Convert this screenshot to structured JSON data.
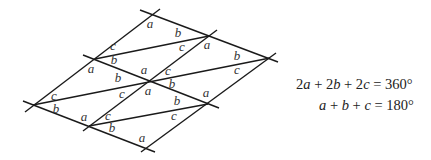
{
  "diagram": {
    "vertices": {
      "top": [
        153,
        15
      ],
      "upper_right": [
        209,
        36
      ],
      "right": [
        270,
        58
      ],
      "upper_left": [
        95,
        59
      ],
      "center": [
        150,
        80
      ],
      "mid_right": [
        208,
        104
      ],
      "left": [
        33,
        105
      ],
      "lower_left": [
        89,
        126
      ],
      "bottom": [
        145,
        148
      ]
    },
    "lines": [
      {
        "name": "top-edge",
        "from": [
          140,
          10
        ],
        "to": [
          278,
          62
        ]
      },
      {
        "name": "middle-edge",
        "from": [
          83,
          55
        ],
        "to": [
          219,
          108
        ]
      },
      {
        "name": "bottom-edge",
        "from": [
          23,
          101
        ],
        "to": [
          155,
          152
        ]
      },
      {
        "name": "left-edge",
        "from": [
          25,
          112
        ],
        "to": [
          160,
          9
        ]
      },
      {
        "name": "center-diagonal-edge",
        "from": [
          83,
          131
        ],
        "to": [
          217,
          30
        ]
      },
      {
        "name": "right-edge",
        "from": [
          141,
          152
        ],
        "to": [
          276,
          53
        ]
      },
      {
        "name": "upper-diagonal",
        "from": [
          95,
          59
        ],
        "to": [
          209,
          36
        ]
      },
      {
        "name": "middle-diagonal",
        "from": [
          33,
          105
        ],
        "to": [
          270,
          58
        ]
      },
      {
        "name": "lower-diagonal",
        "from": [
          89,
          126
        ],
        "to": [
          208,
          104
        ]
      }
    ],
    "labels": [
      {
        "text": "a",
        "x": 150,
        "y": 28
      },
      {
        "text": "b",
        "x": 178,
        "y": 37
      },
      {
        "text": "c",
        "x": 113,
        "y": 50
      },
      {
        "text": "c",
        "x": 182,
        "y": 51
      },
      {
        "text": "a",
        "x": 207,
        "y": 49
      },
      {
        "text": "b",
        "x": 114,
        "y": 64
      },
      {
        "text": "b",
        "x": 237,
        "y": 60
      },
      {
        "text": "a",
        "x": 91,
        "y": 73
      },
      {
        "text": "a",
        "x": 144,
        "y": 74
      },
      {
        "text": "c",
        "x": 168,
        "y": 75
      },
      {
        "text": "c",
        "x": 237,
        "y": 74
      },
      {
        "text": "b",
        "x": 118,
        "y": 82
      },
      {
        "text": "b",
        "x": 172,
        "y": 88
      },
      {
        "text": "a",
        "x": 148,
        "y": 95
      },
      {
        "text": "c",
        "x": 54,
        "y": 100
      },
      {
        "text": "c",
        "x": 122,
        "y": 98
      },
      {
        "text": "a",
        "x": 206,
        "y": 97
      },
      {
        "text": "b",
        "x": 177,
        "y": 105
      },
      {
        "text": "b",
        "x": 56,
        "y": 113
      },
      {
        "text": "a",
        "x": 84,
        "y": 121
      },
      {
        "text": "c",
        "x": 108,
        "y": 120
      },
      {
        "text": "c",
        "x": 174,
        "y": 120
      },
      {
        "text": "b",
        "x": 112,
        "y": 132
      },
      {
        "text": "a",
        "x": 142,
        "y": 142
      }
    ]
  },
  "equations": {
    "line1": {
      "parts": [
        {
          "t": "2",
          "i": false
        },
        {
          "t": "a",
          "i": true
        },
        {
          "t": " + 2",
          "i": false
        },
        {
          "t": "b",
          "i": true
        },
        {
          "t": " + 2",
          "i": false
        },
        {
          "t": "c",
          "i": true
        },
        {
          "t": " = 360°",
          "i": false
        }
      ],
      "text": "2a + 2b + 2c = 360°"
    },
    "line2": {
      "parts": [
        {
          "t": "a",
          "i": true
        },
        {
          "t": " + ",
          "i": false
        },
        {
          "t": "b",
          "i": true
        },
        {
          "t": " + ",
          "i": false
        },
        {
          "t": "c",
          "i": true
        },
        {
          "t": " = 180°",
          "i": false
        }
      ],
      "text": "a + b + c = 180°"
    }
  }
}
